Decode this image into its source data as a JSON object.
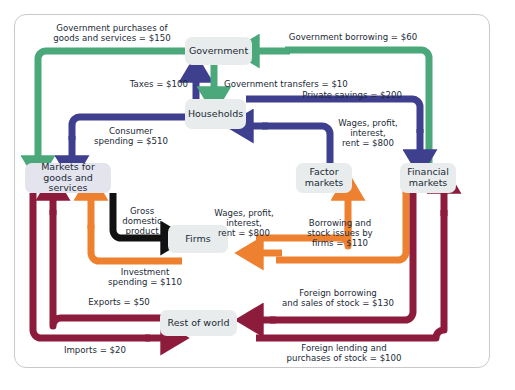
{
  "figure": {
    "type": "circular-flow-diagram"
  },
  "colors": {
    "green": "#4aa87a",
    "navy": "#3f3f8f",
    "orange": "#ee8130",
    "maroon": "#8c1b3c",
    "black": "#111111",
    "node_gray": "#e8ecec",
    "node_lavender": "#e4e4ef",
    "frame_border": "#c9c9c9",
    "text": "#1b2a36"
  },
  "nodes": {
    "government": "Government",
    "households": "Households",
    "markets_goods": "Markets for goods\nand services",
    "factor_markets": "Factor\nmarkets",
    "financial_markets": "Financial\nmarkets",
    "firms": "Firms",
    "rest_of_world": "Rest of world"
  },
  "flows": [
    {
      "id": "gov-purchases",
      "label": "Government purchases of\ngoods and services = $150",
      "value": 150,
      "color": "green",
      "from": "Government",
      "to": "Markets for goods and services"
    },
    {
      "id": "gov-borrowing",
      "label": "Government borrowing = $60",
      "value": 60,
      "color": "green",
      "from": "Financial markets",
      "to": "Government"
    },
    {
      "id": "taxes",
      "label": "Taxes = $100",
      "value": 100,
      "color": "navy",
      "from": "Households",
      "to": "Government"
    },
    {
      "id": "gov-transfers",
      "label": "Government transfers = $10",
      "value": 10,
      "color": "green",
      "from": "Government",
      "to": "Households"
    },
    {
      "id": "private-savings",
      "label": "Private savings = $200",
      "value": 200,
      "color": "navy",
      "from": "Households",
      "to": "Financial markets"
    },
    {
      "id": "consumer-spending",
      "label": "Consumer\nspending = $510",
      "value": 510,
      "color": "navy",
      "from": "Households",
      "to": "Markets for goods and services"
    },
    {
      "id": "wages-to-households",
      "label": "Wages, profit,\ninterest,\nrent = $800",
      "value": 800,
      "color": "navy",
      "from": "Factor markets",
      "to": "Households"
    },
    {
      "id": "gdp",
      "label": "Gross\ndomestic\nproduct",
      "value": null,
      "color": "black",
      "from": "Markets for goods and services",
      "to": "Firms"
    },
    {
      "id": "investment",
      "label": "Investment\nspending = $110",
      "value": 110,
      "color": "orange",
      "from": "Firms",
      "to": "Markets for goods and services"
    },
    {
      "id": "wages-from-firms",
      "label": "Wages, profit,\ninterest,\nrent = $800",
      "value": 800,
      "color": "orange",
      "from": "Firms",
      "to": "Factor markets"
    },
    {
      "id": "borrowing-stock",
      "label": "Borrowing and\nstock issues by\nfirms = $110",
      "value": 110,
      "color": "orange",
      "from": "Financial markets",
      "to": "Firms"
    },
    {
      "id": "exports",
      "label": "Exports = $50",
      "value": 50,
      "color": "maroon",
      "from": "Rest of world",
      "to": "Markets for goods and services"
    },
    {
      "id": "imports",
      "label": "Imports = $20",
      "value": 20,
      "color": "maroon",
      "from": "Markets for goods and services",
      "to": "Rest of world"
    },
    {
      "id": "foreign-borrowing",
      "label": "Foreign borrowing\nand sales of stock = $130",
      "value": 130,
      "color": "maroon",
      "from": "Financial markets",
      "to": "Rest of world"
    },
    {
      "id": "foreign-lending",
      "label": "Foreign lending and\npurchases of stock = $100",
      "value": 100,
      "color": "maroon",
      "from": "Rest of world",
      "to": "Financial markets"
    }
  ],
  "labels": {
    "gov_purchases": "Government purchases of\ngoods and services = $150",
    "gov_borrowing": "Government borrowing = $60",
    "taxes": "Taxes = $100",
    "gov_transfers": "Government transfers = $10",
    "private_savings": "Private savings = $200",
    "consumer_spending": "Consumer\nspending = $510",
    "wages_households": "Wages, profit,\ninterest,\nrent = $800",
    "gdp": "Gross\ndomestic\nproduct",
    "investment": "Investment\nspending = $110",
    "wages_firms": "Wages, profit,\ninterest,\nrent = $800",
    "borrowing_stock": "Borrowing and\nstock issues by\nfirms = $110",
    "exports": "Exports = $50",
    "imports": "Imports = $20",
    "foreign_borrowing": "Foreign borrowing\nand sales of stock = $130",
    "foreign_lending": "Foreign lending and\npurchases of stock = $100"
  }
}
